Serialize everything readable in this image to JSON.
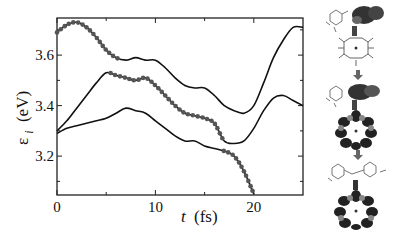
{
  "chart_data": {
    "type": "line",
    "title": "",
    "xlabel": "t (fs)",
    "ylabel": "ε_i (eV)",
    "xlim": [
      0,
      25
    ],
    "ylim": [
      3.046,
      3.747
    ],
    "x_ticks": [
      0,
      10,
      20
    ],
    "x_tick_labels": [
      "0",
      "10",
      "20"
    ],
    "x_minor_ticks": [
      5,
      15
    ],
    "y_ticks": [
      3.2,
      3.4,
      3.6
    ],
    "y_tick_labels": [
      "3.2",
      "3.4",
      "3.6"
    ],
    "y_minor_ticks": [
      3.1,
      3.3,
      3.5,
      3.7
    ],
    "grid": false,
    "legend": null,
    "x": [
      0,
      1,
      2,
      3,
      4,
      5,
      6,
      7,
      8,
      9,
      10,
      11,
      12,
      13,
      14,
      15,
      16,
      17,
      18,
      19,
      20,
      21,
      22,
      23,
      24,
      25
    ],
    "series": [
      {
        "name": "upper level",
        "values": [
          3.69,
          3.72,
          3.73,
          3.71,
          3.67,
          3.62,
          3.59,
          3.58,
          3.59,
          3.58,
          3.58,
          3.55,
          3.51,
          3.48,
          3.47,
          3.47,
          3.44,
          3.4,
          3.38,
          3.37,
          3.4,
          3.49,
          3.59,
          3.66,
          3.71,
          3.71
        ],
        "marked_range": [
          0,
          6.5
        ]
      },
      {
        "name": "middle level",
        "values": [
          3.3,
          3.34,
          3.39,
          3.44,
          3.49,
          3.53,
          3.52,
          3.51,
          3.5,
          3.51,
          3.48,
          3.44,
          3.4,
          3.37,
          3.36,
          3.35,
          3.33,
          3.26,
          3.25,
          3.26,
          3.31,
          3.38,
          3.43,
          3.44,
          3.42,
          3.4
        ],
        "marked_range": [
          5.5,
          17
        ]
      },
      {
        "name": "lower level",
        "values": [
          3.29,
          3.31,
          3.32,
          3.33,
          3.34,
          3.35,
          3.37,
          3.39,
          3.38,
          3.37,
          3.34,
          3.31,
          3.28,
          3.26,
          3.26,
          3.24,
          3.23,
          3.22,
          3.2,
          3.14,
          3.05,
          null,
          null,
          null,
          null,
          null
        ],
        "marked_range": [
          17,
          20
        ]
      }
    ],
    "annotation": "filled circles mark the occupied (tracked) level at each time"
  },
  "axes": {
    "xlabel_italic": "t",
    "xlabel_unit": "(fs)",
    "ylabel_symbol": "ε",
    "ylabel_sub": "i",
    "ylabel_unit": "(eV)"
  },
  "inset_panels": {
    "count": 3,
    "description": [
      "orbital density on acceptor (top)",
      "orbital density on porphyrin ring (middle)",
      "orbital density on porphyrin ring (bottom)"
    ],
    "arrow_icon": "down-arrow-icon"
  },
  "colors": {
    "line": "#111111",
    "marker": "#555555",
    "axis": "#222222"
  }
}
